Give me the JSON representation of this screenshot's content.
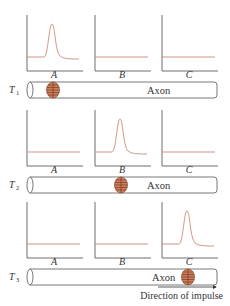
{
  "figure": {
    "axon_label": "Axon",
    "direction_label": "Direction of impulse",
    "panel_labels": [
      "A",
      "B",
      "C"
    ],
    "trace_color": "#c98a78",
    "excited_region_color": "#c9835f",
    "rows": [
      {
        "time_label": "T",
        "time_subscript": "1",
        "active_panel": 0,
        "excited_position": "A"
      },
      {
        "time_label": "T",
        "time_subscript": "2",
        "active_panel": 1,
        "excited_position": "B"
      },
      {
        "time_label": "T",
        "time_subscript": "3",
        "active_panel": 2,
        "excited_position": "C"
      }
    ]
  }
}
